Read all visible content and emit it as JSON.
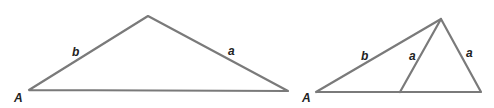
{
  "diagram": {
    "colors": {
      "stroke": "#7a7a7a",
      "label": "#222222",
      "background": "#ffffff"
    },
    "triangle_left": {
      "vertices": {
        "A": [
          29,
          90
        ],
        "apex": [
          148,
          16
        ],
        "right": [
          288,
          91
        ]
      },
      "labels": {
        "vertex_A": "A",
        "side_b": "b",
        "side_a": "a"
      }
    },
    "triangle_right": {
      "vertices": {
        "A": [
          316,
          92
        ],
        "apex": [
          441,
          19
        ],
        "inner_foot": [
          400,
          92
        ],
        "right": [
          481,
          92
        ]
      },
      "labels": {
        "vertex_A": "A",
        "side_b": "b",
        "side_a_inner": "a",
        "side_a_outer": "a"
      }
    }
  }
}
